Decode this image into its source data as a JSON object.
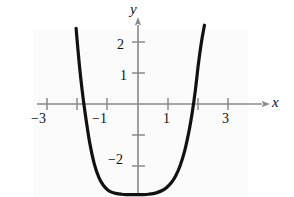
{
  "figure": {
    "background_color": "#ffffff",
    "panel_color": "#fbfbfb",
    "axis_color": "#8a8a8a",
    "curve_color": "#111111",
    "text_color": "#111111"
  },
  "labels": {
    "x_axis": "x",
    "y_axis": "y"
  },
  "ticks": {
    "x": [
      {
        "value": -3,
        "label": "−3"
      },
      {
        "value": -1,
        "label": "−1"
      },
      {
        "value": 1,
        "label": "1"
      },
      {
        "value": 3,
        "label": "3"
      }
    ],
    "y": [
      {
        "value": 2,
        "label": "2"
      },
      {
        "value": 1,
        "label": "1"
      },
      {
        "value": -2,
        "label": "−2"
      }
    ]
  },
  "chart_data": {
    "type": "line",
    "title": "",
    "xlabel": "x",
    "ylabel": "y",
    "xlim": [
      -3.6,
      3.6
    ],
    "ylim": [
      -3.3,
      2.7
    ],
    "grid": false,
    "legend": null,
    "xticks": [
      -3,
      -2,
      -1,
      0,
      1,
      2,
      3
    ],
    "xticklabels": [
      "−3",
      "",
      "−1",
      "",
      "1",
      "",
      "3"
    ],
    "yticks": [
      2,
      1,
      -1,
      -2
    ],
    "yticklabels": [
      "2",
      "1",
      "",
      "−2"
    ],
    "annotations": [],
    "series": [
      {
        "name": "curve",
        "description": "U-shaped flat-bottomed even curve with vertex near (0, -2.9), x-intercepts near x = -1.8 and x = 2.0, drawn from x = -2.05 to x = 2.2",
        "color": "#111111",
        "linewidth": 3.2,
        "x": [
          -2.05,
          -1.95,
          -1.85,
          -1.75,
          -1.6,
          -1.45,
          -1.3,
          -1.15,
          -1.0,
          -0.85,
          -0.7,
          -0.55,
          -0.4,
          -0.25,
          -0.1,
          0.05,
          0.2,
          0.35,
          0.5,
          0.65,
          0.8,
          0.95,
          1.1,
          1.25,
          1.4,
          1.55,
          1.7,
          1.8,
          1.9,
          2.0,
          2.1,
          2.2
        ],
        "y": [
          2.45,
          1.35,
          0.45,
          -0.3,
          -1.25,
          -1.93,
          -2.37,
          -2.63,
          -2.78,
          -2.86,
          -2.9,
          -2.92,
          -2.93,
          -2.93,
          -2.93,
          -2.93,
          -2.93,
          -2.92,
          -2.9,
          -2.86,
          -2.8,
          -2.7,
          -2.55,
          -2.32,
          -1.98,
          -1.5,
          -0.82,
          -0.25,
          0.45,
          1.3,
          2.0,
          2.55
        ]
      }
    ]
  }
}
